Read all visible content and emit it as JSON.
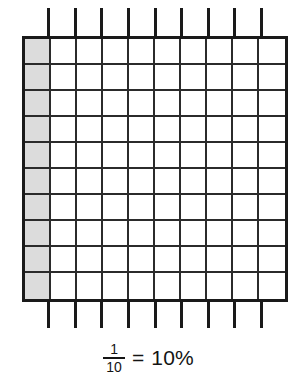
{
  "figure": {
    "type": "percent-grid-diagram",
    "title": "",
    "grid": {
      "columns": 10,
      "rows": 10,
      "total_cells": 100,
      "shaded_cells": 10,
      "shaded_region": "first-column",
      "shaded_color": "#dcdcdc",
      "unshaded_color": "#ffffff",
      "line_color": "#1a1a1a",
      "extended_dividers": 9
    }
  },
  "caption": {
    "numerator": "1",
    "denominator": "10",
    "equals": "=",
    "percent": "10%",
    "full_text": "1/10 = 10%"
  },
  "chart_data": {
    "type": "heatmap",
    "title": "1/10 = 10%",
    "xlabel": "",
    "ylabel": "",
    "categories": [
      "c1",
      "c2",
      "c3",
      "c4",
      "c5",
      "c6",
      "c7",
      "c8",
      "c9",
      "c10"
    ],
    "rows": [
      "r1",
      "r2",
      "r3",
      "r4",
      "r5",
      "r6",
      "r7",
      "r8",
      "r9",
      "r10"
    ],
    "values": [
      [
        1,
        0,
        0,
        0,
        0,
        0,
        0,
        0,
        0,
        0
      ],
      [
        1,
        0,
        0,
        0,
        0,
        0,
        0,
        0,
        0,
        0
      ],
      [
        1,
        0,
        0,
        0,
        0,
        0,
        0,
        0,
        0,
        0
      ],
      [
        1,
        0,
        0,
        0,
        0,
        0,
        0,
        0,
        0,
        0
      ],
      [
        1,
        0,
        0,
        0,
        0,
        0,
        0,
        0,
        0,
        0
      ],
      [
        1,
        0,
        0,
        0,
        0,
        0,
        0,
        0,
        0,
        0
      ],
      [
        1,
        0,
        0,
        0,
        0,
        0,
        0,
        0,
        0,
        0
      ],
      [
        1,
        0,
        0,
        0,
        0,
        0,
        0,
        0,
        0,
        0
      ],
      [
        1,
        0,
        0,
        0,
        0,
        0,
        0,
        0,
        0,
        0
      ],
      [
        1,
        0,
        0,
        0,
        0,
        0,
        0,
        0,
        0,
        0
      ]
    ],
    "shaded_count": 10,
    "total_count": 100,
    "fraction": "1/10",
    "percent": 10,
    "grid": true,
    "legend": "none"
  }
}
